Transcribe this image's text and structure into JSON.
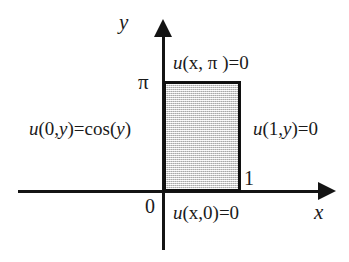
{
  "figure": {
    "background_color": "#ffffff",
    "line_color": "#141414",
    "fill_color": "#d6d6d6"
  },
  "axes": {
    "x_label": "x",
    "y_label": "y"
  },
  "ticks": {
    "pi": "π",
    "zero": "0",
    "one": "1"
  },
  "boundary_conditions": {
    "top": {
      "u": "u",
      "args": "(x, π )=0",
      "full": "u(x, π )=0"
    },
    "left": {
      "u": "u",
      "args": "(0,",
      "var": "y",
      "tail": ")=cos(",
      "var2": "y",
      "close": ")",
      "full": "u(0,y)=cos(y)"
    },
    "right": {
      "u": "u",
      "args": "(1,",
      "var": "y",
      "tail": ")=0",
      "full": "u(1,y)=0"
    },
    "bottom": {
      "u": "u",
      "args": "(x,0)=0",
      "full": "u(x,0)=0"
    }
  },
  "domain": {
    "x_range": "0 to 1",
    "y_range": "0 to π"
  }
}
